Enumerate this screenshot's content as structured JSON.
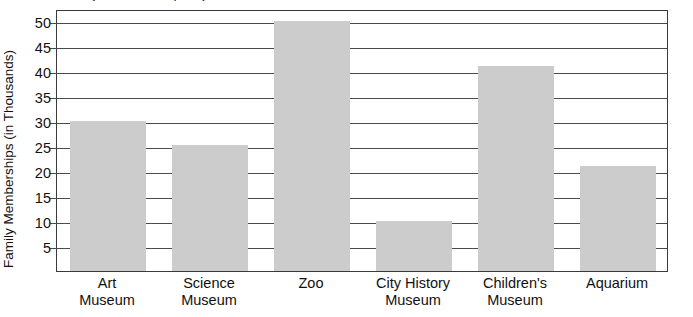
{
  "clipped_caption": "Family Memberships by Institution",
  "chart_data": {
    "type": "bar",
    "title": "",
    "xlabel": "",
    "ylabel": "Family Memberships (in Thousands)",
    "categories": [
      "Art Museum",
      "Science Museum",
      "Zoo",
      "City History Museum",
      "Children's Museum",
      "Aquarium"
    ],
    "category_lines": [
      [
        "Art",
        "Museum"
      ],
      [
        "Science",
        "Museum"
      ],
      [
        "Zoo",
        ""
      ],
      [
        "City History",
        "Museum"
      ],
      [
        "Children's",
        "Museum"
      ],
      [
        "Aquarium",
        ""
      ]
    ],
    "values": [
      30,
      25.3,
      50,
      10,
      41,
      21
    ],
    "ylim": [
      0,
      52.5
    ],
    "yticks": [
      5,
      10,
      15,
      20,
      25,
      30,
      35,
      40,
      45,
      50
    ],
    "ytick_labels": [
      "5",
      "10",
      "15",
      "20",
      "25",
      "30",
      "35",
      "40",
      "45",
      "50"
    ],
    "grid": true,
    "legend": false,
    "bar_color": "#cccccc",
    "axis_color": "#3a3a3a",
    "grid_color": "#4a4a4a"
  }
}
